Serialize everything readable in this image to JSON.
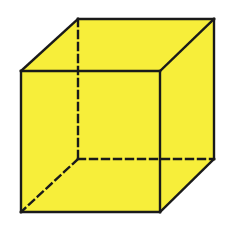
{
  "figure": {
    "type": "cube",
    "fill_color": "#f7ee3a",
    "edge_color": "#1a1a1a",
    "background": "#ffffff",
    "vertices": {
      "front_top_left": [
        21,
        71
      ],
      "front_top_right": [
        160,
        71
      ],
      "front_bottom_left": [
        21,
        212
      ],
      "front_bottom_right": [
        160,
        212
      ],
      "back_top_left": [
        78,
        19
      ],
      "back_top_right": [
        214,
        19
      ],
      "back_bottom_left": [
        78,
        159
      ],
      "back_bottom_right": [
        214,
        159
      ]
    },
    "hidden_edges": [
      "back_top_left-back_bottom_left",
      "back_bottom_left-back_bottom_right",
      "back_bottom_left-front_bottom_left"
    ]
  }
}
